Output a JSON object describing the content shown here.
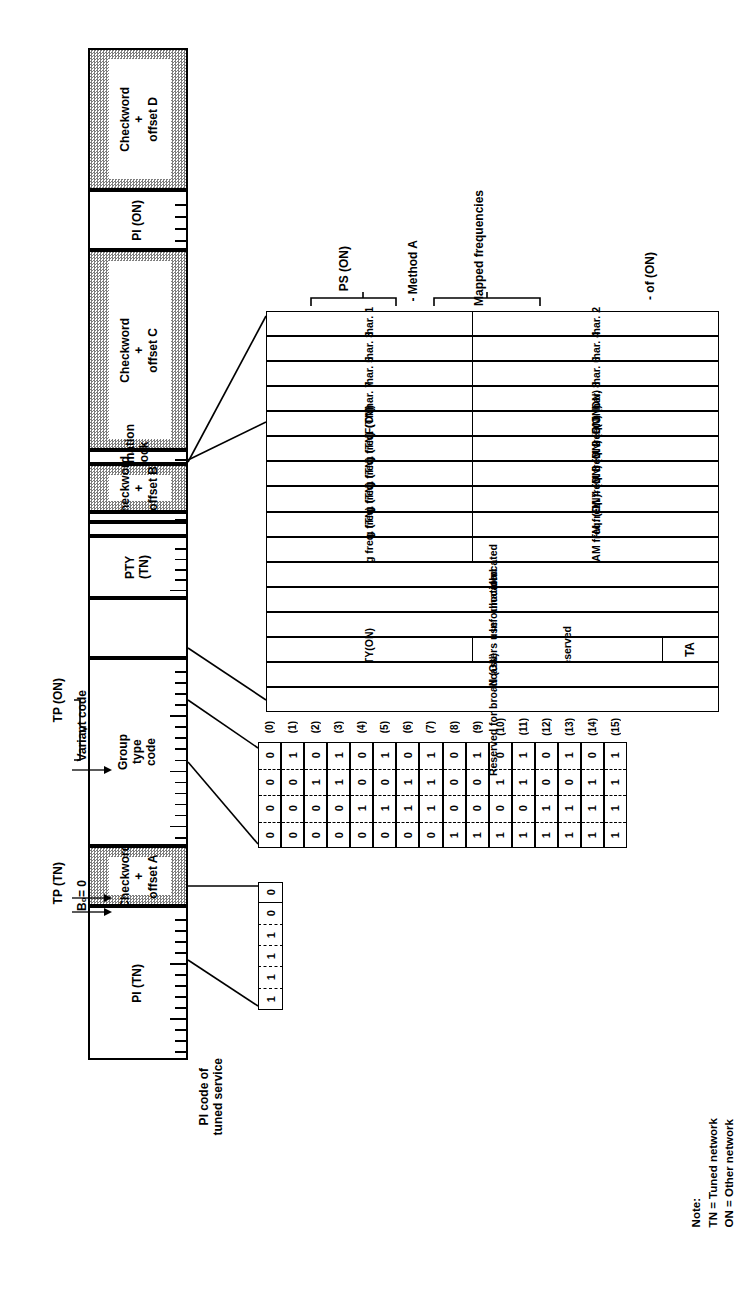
{
  "diagram": {
    "orientation": "rotated-90-ccw"
  },
  "frame": {
    "segments": [
      {
        "name": "pi-tn",
        "label": "PI (TN)",
        "kind": "info",
        "ruler": true
      },
      {
        "name": "checkword-a",
        "label": "Checkword\n+\noffset A",
        "kind": "checkword",
        "ruler": false
      },
      {
        "name": "group-type",
        "label": "Group\ntype\ncode",
        "kind": "info",
        "ruler": true
      },
      {
        "name": "tp-tn-bit",
        "label": "",
        "kind": "info",
        "ruler": false
      },
      {
        "name": "pty-tn",
        "label": "PTY\n(TN)",
        "kind": "info",
        "ruler": true
      },
      {
        "name": "tp-on-bit",
        "label": "",
        "kind": "info",
        "ruler": false
      },
      {
        "name": "variant-code",
        "label": "",
        "kind": "info",
        "ruler": true
      },
      {
        "name": "checkword-b",
        "label": "Checkword\n+\noffset B",
        "kind": "checkword",
        "ruler": false
      },
      {
        "name": "information-block",
        "label": "Information\nblock",
        "kind": "info",
        "ruler": true
      },
      {
        "name": "checkword-c",
        "label": "Checkword\n+\noffset C",
        "kind": "checkword",
        "ruler": false
      },
      {
        "name": "pi-on",
        "label": "PI (ON)",
        "kind": "info",
        "ruler": true
      },
      {
        "name": "checkword-d",
        "label": "Checkword\n+\noffset D",
        "kind": "checkword",
        "ruler": false
      }
    ]
  },
  "annotations": {
    "pi_code_caption": "PI code of\ntuned service",
    "tp_tn": "TP (TN)",
    "tp_on": "TP (ON)",
    "b0": "B₀= 0",
    "variant_code": "Variant code",
    "ps_on": "PS (ON)",
    "method_a": "- Method A",
    "mapped_frequencies": "Mapped frequencies",
    "ta_of_on": "- of (ON)"
  },
  "note": {
    "heading": "Note:",
    "lines": [
      "TN = Tuned network",
      "ON = Other network"
    ]
  },
  "variant_table": {
    "index_labels": [
      "(0)",
      "(1)",
      "(2)",
      "(3)",
      "(4)",
      "(5)",
      "(6)",
      "(7)",
      "(8)",
      "(9)",
      "(10)",
      "(11)",
      "(12)",
      "(13)",
      "(14)",
      "(15)"
    ],
    "rows": [
      {
        "index": "(0)",
        "left": "char. 1",
        "right": "char. 2",
        "span": false
      },
      {
        "index": "(1)",
        "left": "char. 3",
        "right": "char. 4",
        "span": false
      },
      {
        "index": "(2)",
        "left": "char. 5",
        "right": "char. 6",
        "span": false
      },
      {
        "index": "(3)",
        "left": "char. 7",
        "right": "char. 8",
        "span": false
      },
      {
        "index": "(4)",
        "left": "AF(ON)",
        "right": "AF(ON)",
        "span": false
      },
      {
        "index": "(5)",
        "left": "Tuning freq. (TN)",
        "right": "Mapped FM freq. 1 (ON)",
        "span": false
      },
      {
        "index": "(6)",
        "left": "Tuning freq. (TN)",
        "right": "Mapped FM freq. 2 (ON)",
        "span": false
      },
      {
        "index": "(7)",
        "left": "Tuning freq. (TN)",
        "right": "Mapped FM freq. 3 (ON)",
        "span": false
      },
      {
        "index": "(8)",
        "left": "Tuning freq. (TN)",
        "right": "Mapped FM freq. 4 (ON)",
        "span": false
      },
      {
        "index": "(9)",
        "left": "Tuning freq. (TN)",
        "right": "Mapped AM freq. (ON)",
        "span": false
      },
      {
        "index": "(10)",
        "left": "Unallocated",
        "right": "",
        "span": true
      },
      {
        "index": "(11)",
        "left": "Unallocated",
        "right": "",
        "span": true
      },
      {
        "index": "(12)",
        "left": "Linkage Information",
        "right": "",
        "span": true
      },
      {
        "index": "(13)",
        "left": "PTY(ON)",
        "right": "Reserved",
        "span": false,
        "right_extra": "TA"
      },
      {
        "index": "(14)",
        "left": "PIN (ON)",
        "right": "",
        "span": true
      },
      {
        "index": "(15)",
        "left": "Reserved for broadcasters use",
        "right": "",
        "span": true
      }
    ]
  },
  "variant_bits": {
    "caption": "4-bit variant code, MSB on outer row",
    "rows": [
      [
        "0",
        "1",
        "0",
        "1",
        "0",
        "1",
        "0",
        "1",
        "0",
        "1",
        "0",
        "1",
        "0",
        "1",
        "0",
        "1"
      ],
      [
        "0",
        "0",
        "1",
        "1",
        "0",
        "0",
        "1",
        "1",
        "0",
        "0",
        "1",
        "1",
        "0",
        "0",
        "1",
        "1"
      ],
      [
        "0",
        "0",
        "0",
        "0",
        "1",
        "1",
        "1",
        "1",
        "0",
        "0",
        "0",
        "0",
        "1",
        "1",
        "1",
        "1"
      ],
      [
        "0",
        "0",
        "0",
        "0",
        "0",
        "0",
        "0",
        "0",
        "1",
        "1",
        "1",
        "1",
        "1",
        "1",
        "1",
        "1"
      ]
    ]
  },
  "group_type_bits": {
    "tp_bit": "0",
    "code_bits": [
      "0",
      "1",
      "1",
      "1",
      "1"
    ]
  },
  "colors": {
    "ink": "#000000",
    "checkword_fill": "#7d7d7d",
    "paper": "#ffffff"
  }
}
